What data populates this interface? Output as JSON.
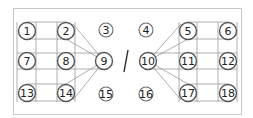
{
  "diagram": {
    "type": "node-grid",
    "frame": {
      "x": 13,
      "y": 8,
      "w": 228,
      "h": 106
    },
    "separator_glyph": "/",
    "nodes": [
      {
        "id": "1",
        "label": "1",
        "x": 27,
        "y": 31,
        "r": 8.5,
        "style": "main"
      },
      {
        "id": "2",
        "label": "2",
        "x": 66,
        "y": 31,
        "r": 8.5,
        "style": "main"
      },
      {
        "id": "3",
        "label": "3",
        "x": 106,
        "y": 30,
        "r": 7,
        "style": "small"
      },
      {
        "id": "4",
        "label": "4",
        "x": 146,
        "y": 30,
        "r": 7,
        "style": "small"
      },
      {
        "id": "5",
        "label": "5",
        "x": 188,
        "y": 31,
        "r": 8.5,
        "style": "main"
      },
      {
        "id": "6",
        "label": "6",
        "x": 228,
        "y": 31,
        "r": 8.5,
        "style": "main"
      },
      {
        "id": "7",
        "label": "7",
        "x": 27,
        "y": 61,
        "r": 8.5,
        "style": "main"
      },
      {
        "id": "8",
        "label": "8",
        "x": 66,
        "y": 61,
        "r": 8.5,
        "style": "main"
      },
      {
        "id": "9",
        "label": "9",
        "x": 104,
        "y": 61,
        "r": 8.5,
        "style": "main"
      },
      {
        "id": "10",
        "label": "10",
        "x": 148,
        "y": 61,
        "r": 8.5,
        "style": "main"
      },
      {
        "id": "11",
        "label": "11",
        "x": 188,
        "y": 61,
        "r": 8.5,
        "style": "main"
      },
      {
        "id": "12",
        "label": "12",
        "x": 228,
        "y": 61,
        "r": 8.5,
        "style": "main"
      },
      {
        "id": "13",
        "label": "13",
        "x": 27,
        "y": 93,
        "r": 8.5,
        "style": "main"
      },
      {
        "id": "14",
        "label": "14",
        "x": 66,
        "y": 93,
        "r": 8.5,
        "style": "main"
      },
      {
        "id": "15",
        "label": "15",
        "x": 106,
        "y": 94,
        "r": 7,
        "style": "small"
      },
      {
        "id": "16",
        "label": "16",
        "x": 146,
        "y": 94,
        "r": 7,
        "style": "small"
      },
      {
        "id": "17",
        "label": "17",
        "x": 188,
        "y": 93,
        "r": 8.5,
        "style": "main"
      },
      {
        "id": "18",
        "label": "18",
        "x": 228,
        "y": 93,
        "r": 8.5,
        "style": "main"
      }
    ],
    "lines": [
      [
        17,
        22,
        17,
        102
      ],
      [
        36,
        22,
        36,
        102
      ],
      [
        57,
        22,
        57,
        102
      ],
      [
        75,
        22,
        75,
        102
      ],
      [
        27,
        22,
        66,
        22
      ],
      [
        27,
        39,
        66,
        39
      ],
      [
        17,
        53,
        104,
        53
      ],
      [
        17,
        69,
        104,
        69
      ],
      [
        27,
        84,
        66,
        84
      ],
      [
        27,
        101,
        66,
        101
      ],
      [
        73,
        24,
        104,
        61
      ],
      [
        66,
        39,
        104,
        61
      ],
      [
        73,
        100,
        104,
        61
      ],
      [
        66,
        84,
        104,
        61
      ],
      [
        179,
        22,
        179,
        102
      ],
      [
        197,
        22,
        197,
        102
      ],
      [
        218,
        22,
        218,
        102
      ],
      [
        237,
        22,
        237,
        102
      ],
      [
        188,
        22,
        228,
        22
      ],
      [
        188,
        39,
        228,
        39
      ],
      [
        148,
        53,
        237,
        53
      ],
      [
        148,
        69,
        237,
        69
      ],
      [
        188,
        84,
        228,
        84
      ],
      [
        188,
        101,
        228,
        101
      ],
      [
        181,
        24,
        148,
        61
      ],
      [
        188,
        39,
        148,
        61
      ],
      [
        181,
        100,
        148,
        61
      ],
      [
        188,
        84,
        148,
        61
      ]
    ],
    "slash": [
      128,
      50,
      124,
      72
    ]
  }
}
